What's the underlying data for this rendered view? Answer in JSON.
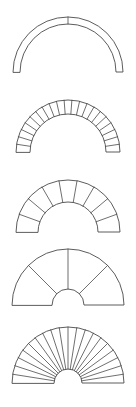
{
  "sheet": {
    "title": "Arch Voussoir Diagrams",
    "width": 136,
    "height": 407,
    "background_color": "#ffffff",
    "stroke_color": "#4a4a4a",
    "fill_color": "#ffffff",
    "figure_count": 5,
    "orientation": "vertical-stack"
  },
  "figures": [
    {
      "id": "arch-1",
      "name": "thin-semicircular-arch",
      "label": "Arch 1",
      "segments": 2,
      "joint_lines": 1,
      "span_px": 110,
      "outer_radius": 55,
      "inner_radius": 48,
      "ring_thickness": 7,
      "center_x": 68,
      "baseline_y": 72,
      "top_y": 17,
      "sweep_degrees": 180,
      "description": "Narrow ring semicircular arch with a single keystone joint at the crown"
    },
    {
      "id": "arch-2",
      "name": "many-voussoir-arch",
      "label": "Arch 2",
      "segments": 21,
      "joint_lines": 20,
      "span_px": 104,
      "outer_radius": 52,
      "inner_radius": 38,
      "ring_thickness": 14,
      "center_x": 68,
      "baseline_y": 152,
      "top_y": 100,
      "sweep_degrees": 180,
      "description": "Medium ring arch divided into twenty-one narrow voussoirs"
    },
    {
      "id": "arch-3",
      "name": "nine-voussoir-arch",
      "label": "Arch 3",
      "segments": 9,
      "joint_lines": 8,
      "span_px": 104,
      "outer_radius": 52,
      "inner_radius": 30,
      "ring_thickness": 22,
      "center_x": 68,
      "baseline_y": 232,
      "top_y": 180,
      "sweep_degrees": 180,
      "description": "Thick ring arch divided into nine broad voussoirs"
    },
    {
      "id": "arch-4",
      "name": "four-sector-fan-arch",
      "label": "Arch 4",
      "segments": 4,
      "joint_lines": 3,
      "span_px": 112,
      "outer_radius": 56,
      "inner_radius": 16,
      "ring_thickness": 40,
      "center_x": 68,
      "baseline_y": 305,
      "top_y": 249,
      "sweep_degrees": 180,
      "description": "Wide fan arch with small inner eye divided into four large sectors"
    },
    {
      "id": "arch-5",
      "name": "twenty-sector-fan-arch",
      "label": "Arch 5",
      "segments": 20,
      "joint_lines": 19,
      "span_px": 112,
      "outer_radius": 56,
      "inner_radius": 14,
      "ring_thickness": 42,
      "center_x": 68,
      "baseline_y": 383,
      "top_y": 327,
      "sweep_degrees": 180,
      "description": "Wide fan arch with small inner eye divided into twenty thin sectors"
    }
  ]
}
